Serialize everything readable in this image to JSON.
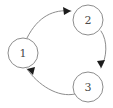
{
  "diagram": {
    "type": "directed-graph",
    "background_color": "#ffffff",
    "node_stroke_color": "#8d8d8d",
    "node_fill_color": "#ffffff",
    "label_color": "#4a4a4a",
    "edge_color": "#8d8d8d",
    "arrowhead_color": "#1c1c1c",
    "node_radius": 15,
    "nodes": [
      {
        "id": "1",
        "label": "1",
        "cx": 23,
        "cy": 53
      },
      {
        "id": "2",
        "label": "2",
        "cx": 88,
        "cy": 20
      },
      {
        "id": "3",
        "label": "3",
        "cx": 88,
        "cy": 87
      }
    ],
    "edges": [
      {
        "id": "edge-1-2",
        "from": "1",
        "to": "2",
        "label": "",
        "path": "M 27,38 C 38,16 54,9 71,11",
        "arrow": "M 71,11 L 63,7 L 64,15 Z"
      },
      {
        "id": "edge-2-3",
        "from": "2",
        "to": "3",
        "label": "",
        "path": "M 101,31 C 108,41 107,57 101,68",
        "arrow": "M 101,68 L 105,60 L 97,61 Z"
      },
      {
        "id": "edge-3-1",
        "from": "3",
        "to": "1",
        "label": "",
        "path": "M 75,94 C 58,98 38,85 27,69",
        "arrow": "M 27,69 L 33,75 L 35,67 Z"
      }
    ]
  }
}
